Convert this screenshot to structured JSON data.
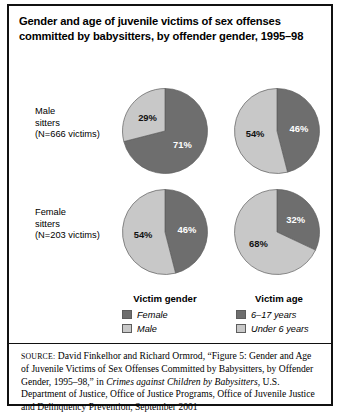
{
  "figure": {
    "title": "Gender and age of juvenile victims of sex offenses committed by babysitters, by offender gender, 1995–98",
    "row_labels": [
      "Male\nsitters\n(N=666 victims)",
      "Female\nsitters\n(N=203 victims)"
    ],
    "column_headers": [
      "Victim gender",
      "Victim age"
    ],
    "colors": {
      "dark": "#6e6e6e",
      "light": "#c8c8c8",
      "outline": "#5d5d5d",
      "frame": "#111111"
    }
  },
  "legends": {
    "gender": {
      "title": "Victim gender",
      "entries": [
        {
          "label": "Female",
          "swatch": "dark"
        },
        {
          "label": "Male",
          "swatch": "light"
        }
      ]
    },
    "age": {
      "title": "Victim age",
      "entries": [
        {
          "label": "6–17 years",
          "swatch": "dark"
        },
        {
          "label": "Under 6 years",
          "swatch": "light"
        }
      ]
    }
  },
  "source": {
    "caps": "SOURCE:",
    "part1": " David Finkelhor and Richard Ormrod, “Figure 5: Gender and Age of Juvenile Victims of Sex Offenses Committed by Babysitters, by Offender Gender, 1995–98,” in ",
    "italic": "Crimes against Children by Babysitters",
    "part2": ", U.S. Department of Justice, Office of Justice Programs, Office of Juvenile Justice and Delinquency Prevention, September 2001"
  },
  "chart_data": {
    "type": "pie",
    "title": "Gender and age of juvenile victims of sex offenses committed by babysitters, by offender gender, 1995–98",
    "charts": [
      {
        "id": "male-sitters-victim-gender",
        "row": "Male sitters (N=666 victims)",
        "column": "Victim gender",
        "labels": [
          "Female",
          "Male"
        ],
        "values": [
          71,
          29
        ],
        "value_labels": [
          "71%",
          "29%"
        ],
        "slice_colors": [
          "dark",
          "light"
        ]
      },
      {
        "id": "male-sitters-victim-age",
        "row": "Male sitters (N=666 victims)",
        "column": "Victim age",
        "labels": [
          "6–17 years",
          "Under 6 years"
        ],
        "values": [
          46,
          54
        ],
        "value_labels": [
          "46%",
          "54%"
        ],
        "slice_colors": [
          "dark",
          "light"
        ]
      },
      {
        "id": "female-sitters-victim-gender",
        "row": "Female sitters (N=203 victims)",
        "column": "Victim gender",
        "labels": [
          "Female",
          "Male"
        ],
        "values": [
          46,
          54
        ],
        "value_labels": [
          "46%",
          "54%"
        ],
        "slice_colors": [
          "dark",
          "light"
        ]
      },
      {
        "id": "female-sitters-victim-age",
        "row": "Female sitters (N=203 victims)",
        "column": "Victim age",
        "labels": [
          "6–17 years",
          "Under 6 years"
        ],
        "values": [
          32,
          68
        ],
        "value_labels": [
          "32%",
          "68%"
        ],
        "slice_colors": [
          "dark",
          "light"
        ]
      }
    ]
  }
}
